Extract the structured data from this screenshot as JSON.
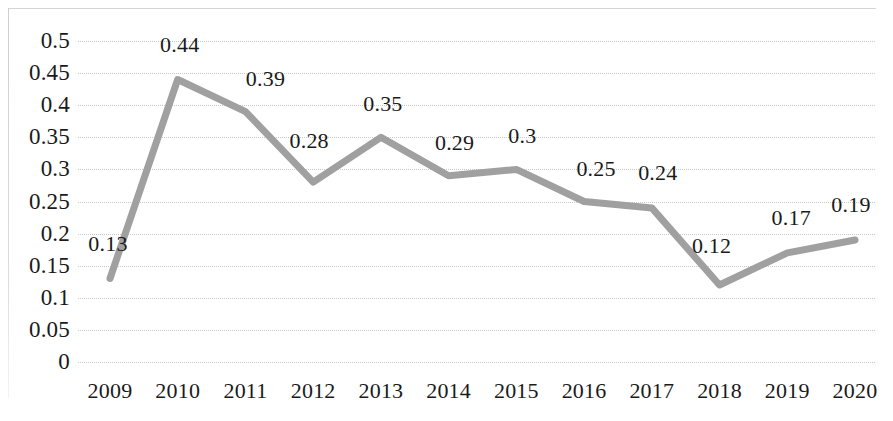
{
  "chart_data": {
    "type": "line",
    "title": "",
    "subtitle": "",
    "xlabel": "",
    "ylabel": "",
    "categories": [
      "2009",
      "2010",
      "2011",
      "2012",
      "2013",
      "2014",
      "2015",
      "2016",
      "2017",
      "2018",
      "2019",
      "2020"
    ],
    "values": [
      0.13,
      0.44,
      0.39,
      0.28,
      0.35,
      0.29,
      0.3,
      0.25,
      0.24,
      0.12,
      0.17,
      0.19
    ],
    "data_labels": [
      "0.13",
      "0.44",
      "0.39",
      "0.28",
      "0.35",
      "0.29",
      "0.3",
      "0.25",
      "0.24",
      "0.12",
      "0.17",
      "0.19"
    ],
    "ylim": [
      0,
      0.5
    ],
    "ytick_values": [
      0,
      0.05,
      0.1,
      0.15,
      0.2,
      0.25,
      0.3,
      0.35,
      0.4,
      0.45,
      0.5
    ],
    "ytick_labels": [
      "0",
      "0.05",
      "0.1",
      "0.15",
      "0.2",
      "0.25",
      "0.3",
      "0.35",
      "0.4",
      "0.45",
      "0.5"
    ],
    "grid": true,
    "grid_style": "dotted",
    "legend": false,
    "legend_position": "none",
    "series": [
      {
        "name": "",
        "values": [
          0.13,
          0.44,
          0.39,
          0.28,
          0.35,
          0.29,
          0.3,
          0.25,
          0.24,
          0.12,
          0.17,
          0.19
        ]
      }
    ],
    "colors": {
      "line": "#a0a0a0",
      "grid": "#c9c9c9",
      "text": "#1a1a1a",
      "background": "#ffffff",
      "frame": "#d4d4d4"
    },
    "line_width": 7
  }
}
